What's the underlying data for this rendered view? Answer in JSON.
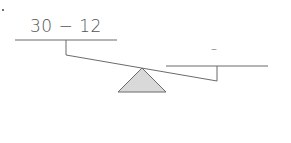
{
  "diagram": {
    "type": "balance-scale",
    "left_pan": {
      "expression": "30 − 12"
    },
    "right_pan": {
      "expression": "–"
    },
    "colors": {
      "line": "#6b6b6b",
      "fulcrum_fill": "#d9d9d9",
      "text": "#555555"
    }
  }
}
